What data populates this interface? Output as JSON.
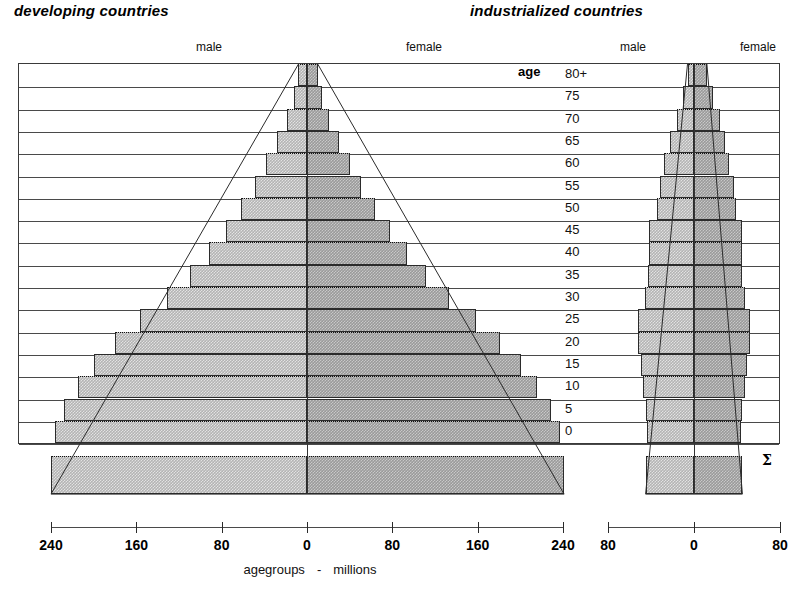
{
  "titles": {
    "developing": "developing countries",
    "industrialized": "industrialized countries"
  },
  "sex_labels": {
    "male_left": "male",
    "female_left": "female",
    "male_right": "male",
    "female_right": "female"
  },
  "age_header": "age",
  "sum_symbol": "Σ",
  "caption": {
    "left": "agegroups",
    "sep": "-",
    "right": "millions"
  },
  "axes": {
    "left": {
      "tick_labels": [
        "240",
        "160",
        "80",
        "0",
        "80",
        "160",
        "240"
      ],
      "tick_values": [
        -240,
        -160,
        -80,
        0,
        80,
        160,
        240
      ],
      "max": 240
    },
    "right": {
      "tick_labels": [
        "80",
        "0",
        "80"
      ],
      "tick_values": [
        -80,
        0,
        80
      ],
      "max": 80
    }
  },
  "colors": {
    "male_fill": "#b4b4b4",
    "female_fill": "#9a9a9a",
    "outline": "#2b2b2b",
    "gridline": "#4a4a4a",
    "text": "#111111"
  },
  "chart_data": {
    "type": "bar",
    "subtitle": "agegroups  -  millions",
    "xlabel": "millions",
    "ylabel": "agegroups",
    "orientation": "horizontal-diverging",
    "grid": true,
    "legend": [
      "male",
      "female"
    ],
    "legend_position": "top",
    "categories": [
      "80+",
      "75",
      "70",
      "65",
      "60",
      "55",
      "50",
      "45",
      "40",
      "35",
      "30",
      "25",
      "20",
      "15",
      "10",
      "5",
      "0"
    ],
    "sum_category": "Σ",
    "panels": [
      {
        "name": "developing countries",
        "xlim": [
          -240,
          240
        ],
        "series": [
          {
            "name": "male",
            "side": "left",
            "values": [
              8,
              12,
              19,
              28,
              38,
              49,
              62,
              76,
              92,
              110,
              131,
              157,
              180,
              200,
              215,
              228,
              236
            ],
            "sum": 240
          },
          {
            "name": "female",
            "side": "right",
            "values": [
              10,
              14,
              21,
              30,
              40,
              51,
              64,
              78,
              94,
              112,
              133,
              158,
              181,
              201,
              216,
              229,
              237
            ],
            "sum": 241
          }
        ]
      },
      {
        "name": "industrialized countries",
        "xlim": [
          -80,
          80
        ],
        "series": [
          {
            "name": "male",
            "side": "left",
            "values": [
              6,
              10,
              16,
              22,
              28,
              32,
              34,
              42,
              42,
              43,
              46,
              52,
              52,
              49,
              47,
              45,
              44
            ],
            "sum": 45
          },
          {
            "name": "female",
            "side": "right",
            "values": [
              12,
              18,
              24,
              29,
              33,
              37,
              39,
              45,
              45,
              45,
              47,
              52,
              52,
              49,
              47,
              45,
              44
            ],
            "sum": 45
          }
        ]
      }
    ]
  }
}
